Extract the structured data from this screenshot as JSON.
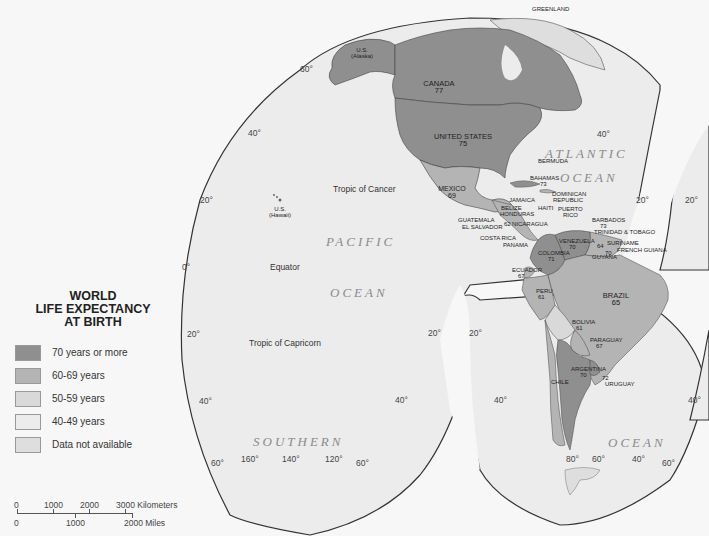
{
  "title": {
    "line1": "WORLD",
    "line2": "LIFE EXPECTANCY",
    "line3": "AT BIRTH"
  },
  "legend": {
    "items": [
      {
        "label": "70 years or more",
        "color": "#8f8f8f"
      },
      {
        "label": "60-69 years",
        "color": "#b4b4b4"
      },
      {
        "label": "50-59 years",
        "color": "#d9d9d9"
      },
      {
        "label": "40-49 years",
        "color": "#ececec"
      },
      {
        "label": "Data not available",
        "color": "#dedede"
      }
    ]
  },
  "scale_bar": {
    "km_ticks": [
      "0",
      "1000",
      "2000",
      "3000 Kilometers"
    ],
    "mile_ticks": [
      "0",
      "1000",
      "2000 Miles"
    ]
  },
  "oceans": {
    "atlantic_1": "ATLANTIC",
    "atlantic_2": "OCEAN",
    "pacific_1": "PACIFIC",
    "pacific_2": "OCEAN",
    "southern_1": "SOUTHERN",
    "southern_2": "OCEAN"
  },
  "geo_lines": {
    "tropic_cancer": "Tropic of Cancer",
    "equator": "Equator",
    "tropic_capricorn": "Tropic of Capricorn"
  },
  "degree_labels": {
    "lat_60_n": "60°",
    "lat_40_n_left": "40°",
    "lat_20_n_left": "20°",
    "lat_0_left": "0°",
    "lat_20_s_left": "20°",
    "lat_40_s_left": "40°",
    "lat_60_s_left": "60°",
    "lat_40_n_right": "40°",
    "lat_20_n_right": "20°",
    "lat_20_n_far": "20°",
    "lat_20_s_mid_a": "20°",
    "lat_20_s_mid_b": "20°",
    "lat_40_s_mid_a": "40°",
    "lat_40_s_mid_b": "40°",
    "lat_60_s_mid": "60°",
    "lat_40_s_right": "40°",
    "lat_60_s_right": "60°",
    "lat_40_s_far": "40°",
    "lon_160": "160°",
    "lon_140": "140°",
    "lon_120": "120°",
    "lon_80": "80°",
    "lon_60": "60°",
    "lon_40": "40°"
  },
  "countries": {
    "us_alaska": {
      "name1": "U.S.",
      "name2": "(Alaska)"
    },
    "us_hawaii": {
      "name1": "U.S.",
      "name2": "(Hawaii)"
    },
    "greenland": {
      "name": "GREENLAND"
    },
    "canada": {
      "name": "CANADA",
      "value": "77"
    },
    "united_states": {
      "name": "UNITED STATES",
      "value": "75"
    },
    "mexico": {
      "name": "MEXICO",
      "value": "69"
    },
    "bermuda": {
      "name": "BERMUDA"
    },
    "bahamas": {
      "name": "BAHAMAS",
      "value": "73"
    },
    "dominican_republic": {
      "name1": "DOMINICAN",
      "name2": "REPUBLIC"
    },
    "jamaica": {
      "name": "JAMAICA"
    },
    "belize": {
      "name": "BELIZE"
    },
    "haiti": {
      "name": "HAITI"
    },
    "puerto_rico": {
      "name1": "PUERTO",
      "name2": "RICO"
    },
    "honduras": {
      "name": "HONDURAS"
    },
    "nicaragua": {
      "name": "NICARAGUA",
      "value": "62"
    },
    "guatemala": {
      "name": "GUATEMALA"
    },
    "el_salvador": {
      "name": "EL SALVADOR"
    },
    "costa_rica": {
      "name": "COSTA RICA"
    },
    "panama": {
      "name": "PANAMA"
    },
    "barbados": {
      "name": "BARBADOS",
      "value": "73"
    },
    "trinidad_tobago": {
      "name": "TRINIDAD & TOBAGO"
    },
    "venezuela": {
      "name": "VENEZUELA",
      "value": "70"
    },
    "suriname": {
      "name": "SURINAME"
    },
    "french_guiana": {
      "name": "FRENCH GUIANA"
    },
    "guyana": {
      "name": "GUYANA",
      "value": "64"
    },
    "colombia": {
      "name": "COLOMBIA",
      "value": "71"
    },
    "ecuador": {
      "name": "ECUADOR",
      "value": "67"
    },
    "peru": {
      "name": "PERU",
      "value": "61"
    },
    "brazil": {
      "name": "BRAZIL",
      "value": "65"
    },
    "bolivia": {
      "name": "BOLIVIA",
      "value": "61"
    },
    "paraguay": {
      "name": "PARAGUAY",
      "value": "67"
    },
    "argentina": {
      "name": "ARGENTINA",
      "value": "70"
    },
    "chile": {
      "name": "CHILE"
    },
    "uruguay": {
      "name": "URUGUAY",
      "value": "72"
    },
    "french_guiana_value": "70"
  }
}
